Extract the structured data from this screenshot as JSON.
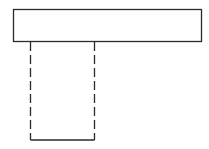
{
  "diagram": {
    "type": "line-drawing",
    "canvas": {
      "width": 209,
      "height": 149,
      "background": "#ffffff"
    },
    "stroke_color": "#2a2a2a",
    "shapes": [
      {
        "id": "top-bar",
        "kind": "rect",
        "x": 13,
        "y": 9,
        "width": 188,
        "height": 32,
        "style": "solid"
      },
      {
        "id": "stem-left",
        "kind": "line",
        "x1": 30,
        "y1": 41,
        "x2": 30,
        "y2": 140,
        "style": "dashed"
      },
      {
        "id": "stem-right",
        "kind": "line",
        "x1": 94,
        "y1": 41,
        "x2": 94,
        "y2": 140,
        "style": "dashed"
      },
      {
        "id": "stem-bottom",
        "kind": "line",
        "x1": 30,
        "y1": 140,
        "x2": 94,
        "y2": 140,
        "style": "solid"
      }
    ]
  }
}
